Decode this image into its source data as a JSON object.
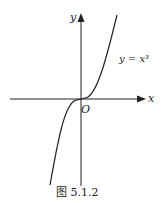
{
  "figure": {
    "caption": "图 5.1.2",
    "axes": {
      "x_label": "x",
      "y_label": "y",
      "origin_label": "O"
    },
    "curve_label": "y = x³",
    "function": "y=x^3",
    "colors": {
      "stroke": "#222222",
      "background": "#ffffff"
    }
  }
}
